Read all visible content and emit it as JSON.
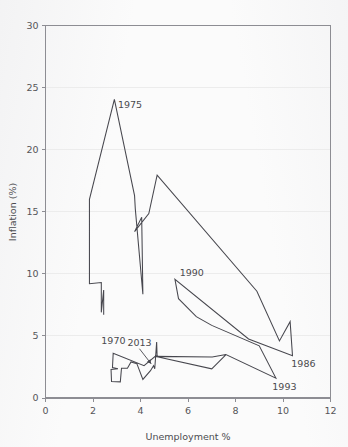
{
  "chart_data": {
    "type": "line",
    "title": "",
    "subtitle": "",
    "xlabel": "Unemployment %",
    "ylabel": "Inflation (%)",
    "xlim": [
      0,
      12
    ],
    "ylim": [
      0,
      30
    ],
    "xticks": [
      "0",
      "2",
      "4",
      "6",
      "8",
      "10",
      "12"
    ],
    "yticks": [
      "0",
      "5",
      "10",
      "15",
      "20",
      "25",
      "30"
    ],
    "xtick_values": [
      0,
      2,
      4,
      6,
      8,
      10,
      12
    ],
    "ytick_values": [
      0,
      5,
      10,
      15,
      20,
      25,
      30
    ],
    "grid": "horizontal",
    "legend": "none",
    "series_name": "UK Phillips curve path",
    "annotations": [
      {
        "label": "1975",
        "x": 3.05,
        "y": 23.6,
        "leader": false
      },
      {
        "label": "1970",
        "x": 2.35,
        "y": 4.6,
        "leader": false
      },
      {
        "label": "2013",
        "x": 3.45,
        "y": 4.45,
        "leader": true,
        "leader_to_x": 4.45,
        "leader_to_y": 2.75
      },
      {
        "label": "1990",
        "x": 5.65,
        "y": 10.1,
        "leader": false
      },
      {
        "label": "1986",
        "x": 10.35,
        "y": 2.8,
        "leader": false
      },
      {
        "label": "1993",
        "x": 9.55,
        "y": 0.9,
        "leader": false
      }
    ],
    "points": [
      [
        1.85,
        16.0
      ],
      [
        1.85,
        9.2
      ],
      [
        2.35,
        9.3
      ],
      [
        2.35,
        6.9
      ],
      [
        2.45,
        8.7
      ],
      [
        2.45,
        6.7
      ],
      [
        2.9,
        24.05
      ],
      [
        3.05,
        22.0
      ],
      [
        3.75,
        16.3
      ],
      [
        3.75,
        13.4
      ],
      [
        4.1,
        15.2
      ],
      [
        4.1,
        8.35
      ],
      [
        4.35,
        14.8
      ],
      [
        4.7,
        17.95
      ],
      [
        5.45,
        9.55
      ],
      [
        5.6,
        8.0
      ],
      [
        6.35,
        6.55
      ],
      [
        6.95,
        5.6
      ],
      [
        8.55,
        4.85
      ],
      [
        8.9,
        8.6
      ],
      [
        9.0,
        4.2
      ],
      [
        9.7,
        1.6
      ],
      [
        9.85,
        4.6
      ],
      [
        10.1,
        3.6
      ],
      [
        10.3,
        6.15
      ],
      [
        10.4,
        3.4
      ],
      [
        2.75,
        2.3
      ],
      [
        2.75,
        1.3
      ],
      [
        2.85,
        3.6
      ],
      [
        3.15,
        1.3
      ],
      [
        3.2,
        2.4
      ],
      [
        3.45,
        2.35
      ],
      [
        3.6,
        2.9
      ],
      [
        3.85,
        2.75
      ],
      [
        4.1,
        1.5
      ],
      [
        4.4,
        2.2
      ],
      [
        4.55,
        2.55
      ],
      [
        4.6,
        2.35
      ],
      [
        4.65,
        4.5
      ],
      [
        4.7,
        3.3
      ],
      [
        4.75,
        2.3
      ],
      [
        7.0,
        2.35
      ],
      [
        7.6,
        3.5
      ]
    ],
    "path_ordered": [
      [
        2.45,
        6.7
      ],
      [
        2.45,
        8.7
      ],
      [
        2.35,
        6.9
      ],
      [
        2.35,
        9.3
      ],
      [
        1.85,
        9.2
      ],
      [
        1.85,
        16.0
      ],
      [
        2.9,
        24.05
      ],
      [
        3.75,
        16.3
      ],
      [
        3.78,
        15.25
      ],
      [
        4.1,
        8.35
      ],
      [
        4.05,
        14.55
      ],
      [
        3.75,
        13.4
      ],
      [
        4.35,
        14.85
      ],
      [
        4.7,
        17.95
      ],
      [
        8.9,
        8.6
      ],
      [
        9.85,
        4.6
      ],
      [
        10.3,
        6.15
      ],
      [
        10.4,
        3.4
      ],
      [
        8.55,
        4.75
      ],
      [
        5.45,
        9.55
      ],
      [
        5.6,
        8.0
      ],
      [
        6.35,
        6.55
      ],
      [
        7.0,
        5.85
      ],
      [
        9.0,
        4.2
      ],
      [
        9.7,
        1.6
      ],
      [
        7.6,
        3.5
      ],
      [
        7.0,
        2.35
      ],
      [
        4.75,
        3.3
      ],
      [
        4.7,
        3.32
      ],
      [
        4.68,
        4.5
      ],
      [
        4.6,
        2.35
      ],
      [
        4.55,
        2.6
      ],
      [
        4.42,
        2.2
      ],
      [
        4.1,
        1.5
      ],
      [
        3.85,
        2.75
      ],
      [
        3.6,
        2.9
      ],
      [
        3.45,
        2.4
      ],
      [
        3.2,
        2.4
      ],
      [
        3.15,
        1.3
      ],
      [
        2.78,
        1.32
      ],
      [
        2.76,
        2.3
      ],
      [
        3.05,
        2.35
      ],
      [
        2.82,
        2.45
      ],
      [
        2.85,
        3.6
      ],
      [
        4.15,
        2.6
      ],
      [
        4.62,
        3.35
      ],
      [
        7.02,
        3.3
      ],
      [
        7.6,
        3.5
      ]
    ]
  },
  "accent_color": "#47474e",
  "grid_color": "#ececec",
  "frame_color": "#8d8d93"
}
